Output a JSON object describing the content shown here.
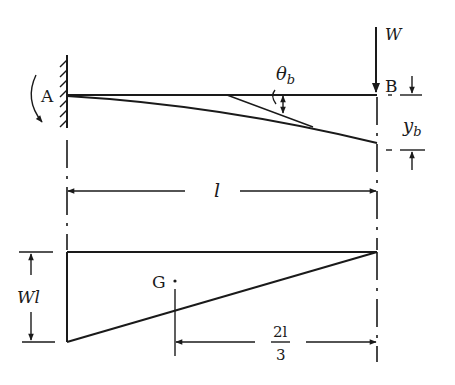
{
  "diagram": {
    "type": "cantilever-beam-deflection-and-moment-diagram",
    "colors": {
      "ink": "#1a1a1a",
      "background": "#ffffff"
    },
    "beam": {
      "fixed_end_label": "A",
      "free_end_label": "B",
      "load_label": "W",
      "slope_label_main": "θ",
      "slope_label_sub": "b",
      "deflection_label_main": "y",
      "deflection_label_sub": "b",
      "length_label": "l"
    },
    "moment_diagram": {
      "height_label": "Wl",
      "centroid_label": "G",
      "centroid_distance_numerator": "2l",
      "centroid_distance_denominator": "3"
    }
  }
}
